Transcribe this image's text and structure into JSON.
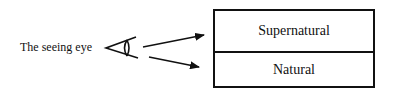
{
  "diagram": {
    "eye_label": "The seeing eye",
    "eye_icon": "eye-icon",
    "arrows": [
      {
        "from": "eye",
        "to": "supernatural"
      },
      {
        "from": "eye",
        "to": "natural"
      }
    ],
    "box": {
      "top_label": "Supernatural",
      "bottom_label": "Natural"
    },
    "colors": {
      "stroke": "#111111",
      "background": "#ffffff"
    }
  }
}
